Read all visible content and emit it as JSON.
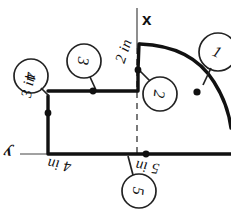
{
  "diagram": {
    "background_color": "#ffffff",
    "ink_color": "#111111",
    "axes": {
      "x_label": "x",
      "y_label": "y"
    },
    "dimensions": [
      {
        "id": "dim-3in",
        "text": "3 in",
        "rotation": -80,
        "x": 18,
        "y": 96
      },
      {
        "id": "dim-2in",
        "text": "2 in",
        "rotation": -72,
        "x": 112,
        "y": 60
      },
      {
        "id": "dim-4in",
        "text": "4 in",
        "rotation": 188,
        "x": 70,
        "y": 175
      },
      {
        "id": "dim-5in",
        "text": "5 in",
        "rotation": 188,
        "x": 158,
        "y": 177
      }
    ],
    "callouts": [
      {
        "id": "callout-1",
        "number": "1",
        "cx": 218,
        "cy": 52,
        "r": 19,
        "rotation": 24,
        "leader_to_x": 200,
        "leader_to_y": 84
      },
      {
        "id": "callout-2",
        "number": "2",
        "cx": 160,
        "cy": 94,
        "r": 17,
        "rotation": 96,
        "leader_to_x": 139,
        "leader_to_y": 70
      },
      {
        "id": "callout-3",
        "number": "3",
        "cx": 84,
        "cy": 61,
        "r": 17,
        "rotation": 96,
        "leader_to_x": 96,
        "leader_to_y": 90
      },
      {
        "id": "callout-4",
        "number": "4",
        "cx": 31,
        "cy": 76,
        "r": 17,
        "rotation": 96,
        "leader_to_x": 49,
        "leader_to_y": 96
      },
      {
        "id": "callout-5",
        "number": "5",
        "cx": 139,
        "cy": 191,
        "r": 17,
        "rotation": 96,
        "leader_to_x": 128,
        "leader_to_y": 155
      }
    ],
    "markers": [
      {
        "id": "vertex-dot-left",
        "x": 48,
        "y": 113
      },
      {
        "id": "vertex-dot-top",
        "x": 93,
        "y": 91
      },
      {
        "id": "vertex-dot-step",
        "x": 138,
        "y": 70
      },
      {
        "id": "vertex-dot-base",
        "x": 146,
        "y": 154
      },
      {
        "id": "centroid-dot-arc",
        "x": 197,
        "y": 92
      }
    ],
    "shape": {
      "rect_left": 48,
      "rect_top": 91,
      "rect_right": 138,
      "rect_bottom": 154,
      "step_top": 43,
      "arc_start_x": 140,
      "arc_start_y": 43,
      "baseline_y": 154
    }
  }
}
